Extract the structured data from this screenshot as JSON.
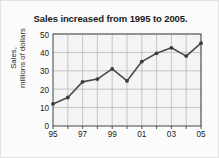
{
  "chart_data": {
    "type": "line",
    "title": "Sales increased from 1995 to 2005.",
    "xlabel": "",
    "ylabel_lines": [
      "Sales,",
      "millions of dollars"
    ],
    "ylabel": "Sales, millions of dollars",
    "x": [
      1995,
      1996,
      1997,
      1998,
      1999,
      2000,
      2001,
      2002,
      2003,
      2004,
      2005
    ],
    "xtick_labels": [
      "95",
      "",
      "97",
      "",
      "99",
      "",
      "01",
      "",
      "03",
      "",
      "05"
    ],
    "xtick_labels_visible": [
      "95",
      "97",
      "99",
      "01",
      "03",
      "05"
    ],
    "values": [
      12,
      15.5,
      24,
      25.5,
      31,
      24.5,
      35,
      39.5,
      42.5,
      38,
      45
    ],
    "ytick_labels": [
      "0",
      "10",
      "20",
      "30",
      "40",
      "50"
    ],
    "ytick_values": [
      0,
      10,
      20,
      30,
      40,
      50
    ],
    "ylim": [
      0,
      50
    ],
    "xlim": [
      1995,
      2005
    ],
    "grid": true,
    "legend": false,
    "markers": true,
    "colors": {
      "line": "#4a4a4a",
      "marker": "#3a3a3a",
      "grid": "#b9b9b9",
      "axis": "#555555",
      "plot_background": "#f4f4f4",
      "page_background": "#fbfbfb",
      "text": "#1a1a1a"
    }
  }
}
